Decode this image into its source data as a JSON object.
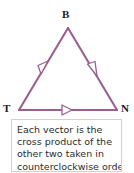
{
  "figure": {
    "name": "vector-triangle-diagram",
    "shape": "triangle",
    "stroke_color": "#9b5f8e",
    "arrow_color": "#9b5f8e",
    "background_color": "#ffffff",
    "vertices": [
      {
        "id": "B",
        "label": "B",
        "x": 68,
        "y": 28,
        "position": "apex"
      },
      {
        "id": "T",
        "label": "T",
        "x": 19,
        "y": 110,
        "position": "bottom-left"
      },
      {
        "id": "N",
        "label": "N",
        "x": 117,
        "y": 110,
        "position": "bottom-right"
      }
    ],
    "edges": [
      {
        "id": "edge-TB",
        "from": "T",
        "to": "B",
        "arrow_direction": "up-right",
        "arrow_at": "midpoint"
      },
      {
        "id": "edge-BN",
        "from": "B",
        "to": "N",
        "arrow_direction": "down-right",
        "arrow_at": "midpoint"
      },
      {
        "id": "edge-TN",
        "from": "T",
        "to": "N",
        "arrow_direction": "right",
        "arrow_at": "midpoint"
      }
    ]
  },
  "caption": {
    "border_color": "#d2d2d2",
    "lines": [
      "Each vector is the",
      "cross product of the",
      "other two taken in",
      "counterclockwise order."
    ]
  }
}
